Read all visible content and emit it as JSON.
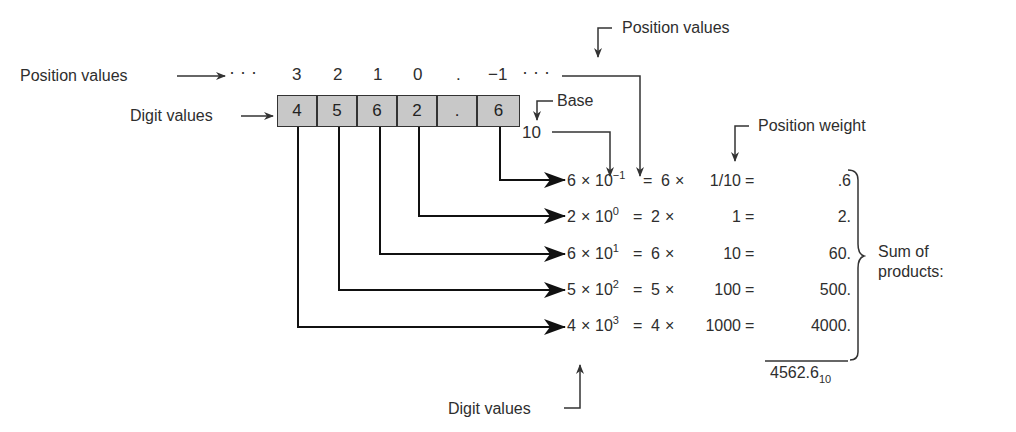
{
  "labels": {
    "position_values_left": "Position values",
    "digit_values_left": "Digit values",
    "position_values_top": "Position values",
    "base": "Base",
    "base_value": "10",
    "position_weight": "Position weight",
    "digit_values_bottom": "Digit values",
    "sum_of": "Sum of",
    "products": "products:"
  },
  "positions": {
    "leading_dots": "· · ·",
    "items": [
      "3",
      "2",
      "1",
      "0",
      ".",
      "−1"
    ],
    "trailing_dots": "· · ·"
  },
  "digits": [
    "4",
    "5",
    "6",
    "2",
    ".",
    "6"
  ],
  "rows": [
    {
      "digit": "6",
      "base": "10",
      "exp": "−1",
      "digit2": "6",
      "weight": "1/10",
      "product": ".6"
    },
    {
      "digit": "2",
      "base": "10",
      "exp": "0",
      "digit2": "2",
      "weight": "1",
      "product": "2."
    },
    {
      "digit": "6",
      "base": "10",
      "exp": "1",
      "digit2": "6",
      "weight": "10",
      "product": "60."
    },
    {
      "digit": "5",
      "base": "10",
      "exp": "2",
      "digit2": "5",
      "weight": "100",
      "product": "500."
    },
    {
      "digit": "4",
      "base": "10",
      "exp": "3",
      "digit2": "4",
      "weight": "1000",
      "product": "4000."
    }
  ],
  "symbols": {
    "times": "×",
    "equals": "="
  },
  "result": {
    "value": "4562.6",
    "base": "10"
  },
  "colors": {
    "cell_fill": "#c8c8c8",
    "line": "#222222",
    "text": "#2e2e2e"
  }
}
